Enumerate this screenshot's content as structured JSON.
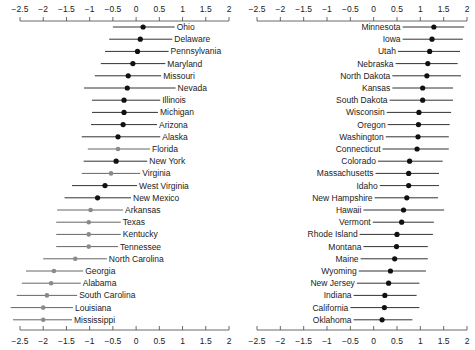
{
  "chart_data": [
    {
      "type": "scatter",
      "subtype": "dot-and-whisker (point estimate with interval)",
      "panel": "left",
      "title": "",
      "xlabel": "",
      "ylabel": "",
      "xlim": [
        -2.5,
        2
      ],
      "xticks": [
        -2.5,
        -2,
        -1.5,
        -1,
        -0.5,
        0,
        0.5,
        1,
        1.5,
        2
      ],
      "xtick_labels": [
        "−2.5",
        "−2",
        "−1.5",
        "−1",
        "−0.5",
        "0",
        "0.5",
        "1",
        "1.5",
        "2"
      ],
      "axes": [
        "top",
        "bottom"
      ],
      "grid": false,
      "label_position": "right-of-interval",
      "series": [
        {
          "name": "Ohio",
          "value": 0.15,
          "low": -0.5,
          "high": 0.83,
          "marker": "black"
        },
        {
          "name": "Delaware",
          "value": 0.09,
          "low": -0.58,
          "high": 0.78,
          "marker": "black"
        },
        {
          "name": "Pennsylvania",
          "value": 0.03,
          "low": -0.67,
          "high": 0.7,
          "marker": "black"
        },
        {
          "name": "Maryland",
          "value": -0.07,
          "low": -0.76,
          "high": 0.63,
          "marker": "black"
        },
        {
          "name": "Missouri",
          "value": -0.17,
          "low": -0.89,
          "high": 0.54,
          "marker": "black"
        },
        {
          "name": "Nevada",
          "value": -0.19,
          "low": -1.12,
          "high": 0.85,
          "marker": "black"
        },
        {
          "name": "Illinois",
          "value": -0.26,
          "low": -0.95,
          "high": 0.52,
          "marker": "black"
        },
        {
          "name": "Michigan",
          "value": -0.26,
          "low": -0.95,
          "high": 0.47,
          "marker": "black"
        },
        {
          "name": "Arizona",
          "value": -0.28,
          "low": -0.97,
          "high": 0.45,
          "marker": "black"
        },
        {
          "name": "Alaska",
          "value": -0.39,
          "low": -1.17,
          "high": 0.52,
          "marker": "black"
        },
        {
          "name": "Florida",
          "value": -0.39,
          "low": -1.04,
          "high": 0.3,
          "marker": "gray"
        },
        {
          "name": "New York",
          "value": -0.43,
          "low": -1.13,
          "high": 0.24,
          "marker": "black"
        },
        {
          "name": "Virginia",
          "value": -0.54,
          "low": -1.17,
          "high": 0.09,
          "marker": "gray"
        },
        {
          "name": "West Virginia",
          "value": -0.67,
          "low": -1.38,
          "high": 0.02,
          "marker": "black"
        },
        {
          "name": "New Mexico",
          "value": -0.83,
          "low": -1.54,
          "high": -0.11,
          "marker": "black"
        },
        {
          "name": "Arkansas",
          "value": -0.98,
          "low": -1.7,
          "high": -0.28,
          "marker": "gray"
        },
        {
          "name": "Texas",
          "value": -1.02,
          "low": -1.72,
          "high": -0.33,
          "marker": "gray"
        },
        {
          "name": "Kentucky",
          "value": -1.02,
          "low": -1.72,
          "high": -0.33,
          "marker": "gray"
        },
        {
          "name": "Tennessee",
          "value": -1.02,
          "low": -1.72,
          "high": -0.39,
          "marker": "gray"
        },
        {
          "name": "North Carolina",
          "value": -1.31,
          "low": -2.0,
          "high": -0.63,
          "marker": "gray"
        },
        {
          "name": "Georgia",
          "value": -1.77,
          "low": -2.37,
          "high": -1.14,
          "marker": "gray"
        },
        {
          "name": "Alabama",
          "value": -1.83,
          "low": -2.46,
          "high": -1.19,
          "marker": "gray"
        },
        {
          "name": "South Carolina",
          "value": -1.92,
          "low": -2.57,
          "high": -1.27,
          "marker": "gray"
        },
        {
          "name": "Louisiana",
          "value": -2.0,
          "low": -2.7,
          "high": -1.36,
          "marker": "gray"
        },
        {
          "name": "Mississippi",
          "value": -2.0,
          "low": -2.65,
          "high": -1.38,
          "marker": "gray"
        }
      ]
    },
    {
      "type": "scatter",
      "subtype": "dot-and-whisker (point estimate with interval)",
      "panel": "right",
      "title": "",
      "xlabel": "",
      "ylabel": "",
      "xlim": [
        -2.5,
        2
      ],
      "xticks": [
        -2.5,
        -2,
        -1.5,
        -1,
        -0.5,
        0,
        0.5,
        1,
        1.5,
        2
      ],
      "xtick_labels": [
        "−2.5",
        "−2",
        "−1.5",
        "−1",
        "−0.5",
        "0",
        "0.5",
        "1",
        "1.5",
        "2"
      ],
      "axes": [
        "top",
        "bottom"
      ],
      "grid": false,
      "label_position": "left-of-interval",
      "series": [
        {
          "name": "Minnesota",
          "value": 1.29,
          "low": 0.62,
          "high": 1.94,
          "marker": "black"
        },
        {
          "name": "Iowa",
          "value": 1.25,
          "low": 0.62,
          "high": 1.91,
          "marker": "black"
        },
        {
          "name": "Utah",
          "value": 1.2,
          "low": 0.52,
          "high": 1.85,
          "marker": "black"
        },
        {
          "name": "Nebraska",
          "value": 1.16,
          "low": 0.47,
          "high": 1.8,
          "marker": "black"
        },
        {
          "name": "North Dakota",
          "value": 1.14,
          "low": 0.4,
          "high": 1.87,
          "marker": "black"
        },
        {
          "name": "Kansas",
          "value": 1.05,
          "low": 0.4,
          "high": 1.7,
          "marker": "black"
        },
        {
          "name": "South Dakota",
          "value": 1.05,
          "low": 0.34,
          "high": 1.7,
          "marker": "black"
        },
        {
          "name": "Wisconsin",
          "value": 0.97,
          "low": 0.28,
          "high": 1.66,
          "marker": "black"
        },
        {
          "name": "Oregon",
          "value": 0.96,
          "low": 0.3,
          "high": 1.63,
          "marker": "black"
        },
        {
          "name": "Washington",
          "value": 0.95,
          "low": 0.26,
          "high": 1.61,
          "marker": "black"
        },
        {
          "name": "Connecticut",
          "value": 0.93,
          "low": 0.19,
          "high": 1.61,
          "marker": "black"
        },
        {
          "name": "Colorado",
          "value": 0.77,
          "low": 0.09,
          "high": 1.48,
          "marker": "black"
        },
        {
          "name": "Massachusetts",
          "value": 0.75,
          "low": 0.04,
          "high": 1.4,
          "marker": "black"
        },
        {
          "name": "Idaho",
          "value": 0.75,
          "low": 0.13,
          "high": 1.4,
          "marker": "black"
        },
        {
          "name": "New Hampshire",
          "value": 0.71,
          "low": 0.02,
          "high": 1.38,
          "marker": "black"
        },
        {
          "name": "Hawaii",
          "value": 0.64,
          "low": -0.22,
          "high": 1.51,
          "marker": "black"
        },
        {
          "name": "Vermont",
          "value": 0.6,
          "low": -0.02,
          "high": 1.29,
          "marker": "black"
        },
        {
          "name": "Rhode Island",
          "value": 0.5,
          "low": -0.3,
          "high": 1.27,
          "marker": "black"
        },
        {
          "name": "Montana",
          "value": 0.49,
          "low": -0.22,
          "high": 1.16,
          "marker": "black"
        },
        {
          "name": "Maine",
          "value": 0.45,
          "low": -0.28,
          "high": 1.16,
          "marker": "black"
        },
        {
          "name": "Wyoming",
          "value": 0.36,
          "low": -0.32,
          "high": 1.12,
          "marker": "black"
        },
        {
          "name": "New Jersey",
          "value": 0.32,
          "low": -0.36,
          "high": 0.98,
          "marker": "black"
        },
        {
          "name": "Indiana",
          "value": 0.24,
          "low": -0.43,
          "high": 0.92,
          "marker": "black"
        },
        {
          "name": "California",
          "value": 0.23,
          "low": -0.5,
          "high": 0.98,
          "marker": "black"
        },
        {
          "name": "Oklahoma",
          "value": 0.18,
          "low": -0.43,
          "high": 0.83,
          "marker": "black"
        }
      ]
    }
  ],
  "colors": {
    "black_marker": "#111111",
    "black_line": "#333333",
    "gray_marker": "#8a8a8a",
    "gray_line": "#666666",
    "axis": "#444444",
    "text": "#222222"
  },
  "layout": {
    "panels": [
      {
        "x0": 20,
        "x1": 229
      },
      {
        "x0": 257,
        "x1": 467
      }
    ],
    "top_axis_y": 21,
    "bottom_axis_y": 330,
    "first_row_y": 27,
    "row_step": 12.2
  }
}
